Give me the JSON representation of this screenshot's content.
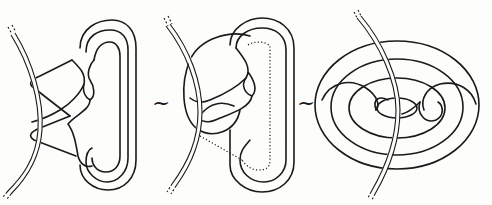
{
  "figure": {
    "panels": [
      {
        "id": "left",
        "label": "knot-diagram-1",
        "elements": [
          "double-strand-axis",
          "folded-band",
          "clasp-twists"
        ]
      },
      {
        "id": "middle",
        "label": "knot-diagram-2",
        "elements": [
          "double-strand-axis",
          "folded-band",
          "dotted-arc",
          "loop-around-axis"
        ]
      },
      {
        "id": "right",
        "label": "knot-diagram-3",
        "elements": [
          "double-strand-axis",
          "torus-curves",
          "knotted-core"
        ]
      }
    ],
    "separators": [
      {
        "symbol": "~",
        "position": "between-left-and-middle"
      },
      {
        "symbol": "~",
        "position": "between-middle-and-right"
      }
    ],
    "stroke_color": "#1a1a1a",
    "background_color": "#fdfdfc"
  }
}
